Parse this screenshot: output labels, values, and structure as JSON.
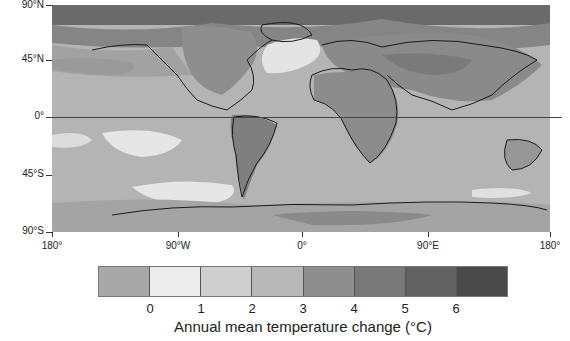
{
  "map": {
    "title": "Annual mean temperature change (°C)",
    "y_axis": {
      "labels": [
        "90°N",
        "45°N",
        "0°",
        "45°S",
        "90°S"
      ],
      "positions_px": [
        5,
        60,
        117,
        175,
        232
      ]
    },
    "x_axis": {
      "labels": [
        "180°",
        "90°W",
        "0°",
        "90°E",
        "180°"
      ],
      "positions_px": [
        52,
        178,
        302,
        428,
        550
      ]
    },
    "background_color": "#b4b4b4",
    "coastline_color": "#1a1a1a"
  },
  "legend": {
    "title": "Annual mean temperature change (°C)",
    "bins": [
      {
        "range": "< 0",
        "color": "#a8a8a8"
      },
      {
        "range": "0–1",
        "color": "#ececec"
      },
      {
        "range": "1–2",
        "color": "#cfcfcf"
      },
      {
        "range": "2–3",
        "color": "#b8b8b8"
      },
      {
        "range": "3–4",
        "color": "#8e8e8e"
      },
      {
        "range": "4–5",
        "color": "#787878"
      },
      {
        "range": "5–6",
        "color": "#626262"
      },
      {
        "range": "> 6",
        "color": "#4a4a4a"
      }
    ],
    "tick_labels": [
      "0",
      "1",
      "2",
      "3",
      "4",
      "5",
      "6"
    ]
  }
}
